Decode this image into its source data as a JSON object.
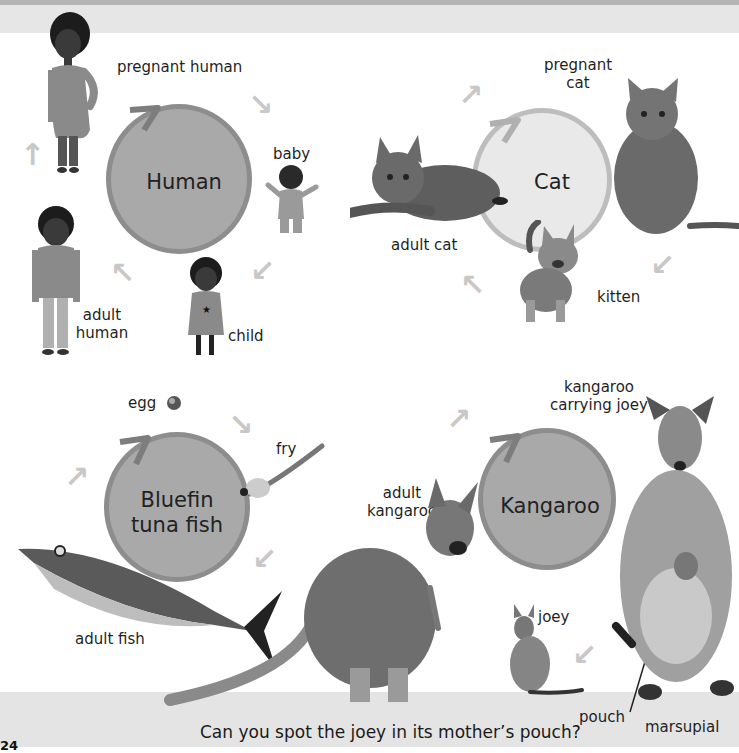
{
  "page": {
    "caption": "Can you spot the joey in its mother’s pouch?",
    "page_number": "24"
  },
  "colors": {
    "top_band": "#b5b5b5",
    "header_strip": "#e6e6e6",
    "footer_strip": "#e4e4e4",
    "circle_fill_dark": "#a9a9a9",
    "circle_fill_light": "#e9e9e9",
    "circle_ring": "#8a8a8a",
    "cycle_arrow": "#c8c8c8"
  },
  "cycles": {
    "human": {
      "title": "Human",
      "stages": {
        "pregnant": "pregnant human",
        "baby": "baby",
        "child": "child",
        "adult_line1": "adult",
        "adult_line2": "human"
      }
    },
    "cat": {
      "title": "Cat",
      "stages": {
        "pregnant_line1": "pregnant",
        "pregnant_line2": "cat",
        "kitten": "kitten",
        "adult": "adult cat"
      }
    },
    "tuna": {
      "title_line1": "Bluefin",
      "title_line2": "tuna fish",
      "stages": {
        "egg": "egg",
        "fry": "fry",
        "adult": "adult fish"
      }
    },
    "kangaroo": {
      "title": "Kangaroo",
      "stages": {
        "carrying_line1": "kangaroo",
        "carrying_line2": "carrying joey",
        "joey": "joey",
        "adult_line1": "adult",
        "adult_line2": "kangaroo",
        "pouch": "pouch",
        "marsupial": "marsupial"
      }
    }
  }
}
